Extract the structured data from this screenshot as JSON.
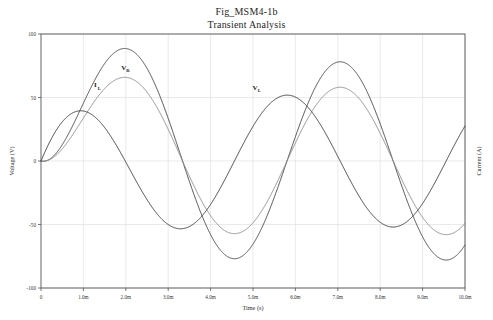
{
  "chart_data": {
    "type": "line",
    "title": "Fig_MSM4-1b",
    "subtitle": "Transient Analysis",
    "xlabel": "Time (s)",
    "ylabel": "Voltage (V)",
    "y2label": "Current (A)",
    "xlim": [
      0,
      0.01
    ],
    "ylim": [
      -100,
      100
    ],
    "grid": true,
    "legend": "inline-annotations",
    "xticks": [
      0,
      0.001,
      0.002,
      0.003,
      0.004,
      0.005,
      0.006,
      0.007,
      0.008,
      0.009,
      0.01
    ],
    "xtick_labels": [
      "0",
      "1.0m",
      "2.0m",
      "3.0m",
      "4.0m",
      "5.0m",
      "6.0m",
      "7.0m",
      "8.0m",
      "9.0m",
      "10.0m"
    ],
    "yticks": [
      100,
      50,
      0,
      -50,
      -100
    ],
    "ytick_labels": [
      "100",
      "50",
      "0",
      "-50",
      "-100"
    ],
    "series": [
      {
        "name": "VR",
        "label": "VR",
        "label_main": "V",
        "label_sub": "R",
        "color": "#4a4a4a",
        "width": 1.0,
        "amplitude": 78,
        "period_ms": 5.0,
        "phase_deg": -58,
        "tau_ms": 1.1,
        "label_x_ms": 1.95,
        "label_y_v": 72,
        "peaks": [
          {
            "t_ms": 1.65,
            "v": 78
          },
          {
            "t_ms": 6.7,
            "v": 78
          }
        ],
        "troughs": [
          {
            "t_ms": 4.2,
            "v": -78
          },
          {
            "t_ms": 9.2,
            "v": -78
          }
        ]
      },
      {
        "name": "IL",
        "label": "IL",
        "label_main": "I",
        "label_sub": "L",
        "color": "#8e8e8e",
        "width": 1.0,
        "amplitude": 58,
        "period_ms": 5.0,
        "phase_deg": -58,
        "tau_ms": 1.1,
        "label_x_ms": 1.28,
        "label_y_v": 58,
        "peaks": [
          {
            "t_ms": 1.7,
            "v": 58
          },
          {
            "t_ms": 6.75,
            "v": 58
          }
        ],
        "troughs": [
          {
            "t_ms": 4.25,
            "v": -58
          },
          {
            "t_ms": 9.25,
            "v": -58
          }
        ]
      },
      {
        "name": "VL",
        "label": "VL",
        "label_main": "V",
        "label_sub": "L",
        "color": "#3c3c3c",
        "width": 1.0,
        "amplitude": 52,
        "period_ms": 5.0,
        "phase_deg": 32,
        "tau_ms": 1.1,
        "label_x_ms": 5.05,
        "label_y_v": 56,
        "peaks": [
          {
            "t_ms": 0.75,
            "v": 28
          },
          {
            "t_ms": 4.5,
            "v": 52
          },
          {
            "t_ms": 9.9,
            "v": 28
          }
        ],
        "troughs": [
          {
            "t_ms": 3.3,
            "v": -30
          },
          {
            "t_ms": 7.9,
            "v": -52
          }
        ]
      }
    ]
  }
}
